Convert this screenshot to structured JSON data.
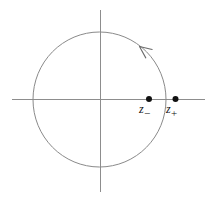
{
  "figure": {
    "background_color": "#ffffff",
    "width": 214,
    "height": 199,
    "axes": {
      "line_color": "#8d8d8d",
      "origin": {
        "x": 100,
        "y": 99.5
      },
      "horizontal": {
        "name": "real-axis",
        "x1": 12,
        "y1": 99.5,
        "x2": 205,
        "y2": 99.5
      },
      "vertical": {
        "name": "imaginary-axis",
        "x1": 100.5,
        "y1": 10,
        "x2": 100.5,
        "y2": 192
      }
    },
    "circle": {
      "name": "unit-circle",
      "center_x": 99.5,
      "center_y": 99.5,
      "radius_x": 66.5,
      "radius_y": 67.5,
      "stroke_color": "#8a8a8a"
    },
    "arrow": {
      "name": "counterclockwise-orientation-arrow",
      "direction": "counterclockwise",
      "tip_x": 139.5,
      "tip_y": 46.5,
      "stroke_color": "#6b6b6b"
    },
    "points": [
      {
        "id": "z-minus",
        "label": "z",
        "subscript": "−",
        "x": 149,
        "y": 99,
        "radius": 3,
        "color": "#111111",
        "location": "inside unit circle"
      },
      {
        "id": "z-plus",
        "label": "z",
        "subscript": "+",
        "x": 175.5,
        "y": 99,
        "radius": 3,
        "color": "#111111",
        "location": "outside unit circle"
      }
    ]
  }
}
